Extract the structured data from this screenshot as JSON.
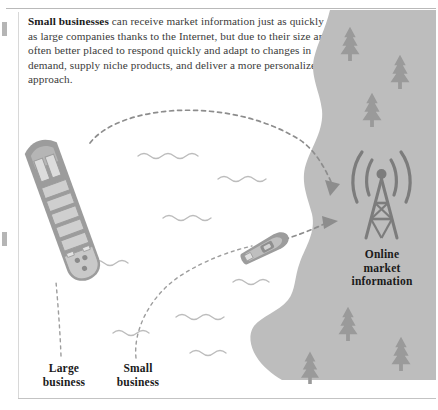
{
  "figure": {
    "paragraph": {
      "lead": "Small businesses",
      "rest": " can receive market information just as quickly as large companies thanks to the Internet, but due to their size are often better placed to respond quickly and adapt to changes in demand, supply niche products, and deliver a more personalized approach."
    },
    "labels": {
      "large_business": "Large\nbusiness",
      "large_business_line1": "Large",
      "large_business_line2": "business",
      "small_business_line1": "Small",
      "small_business_line2": "business",
      "online_line1": "Online",
      "online_line2": "market",
      "online_line3": "information"
    },
    "icons": {
      "large_ship": "cargo-ship-icon",
      "small_boat": "speedboat-icon",
      "tower": "radio-tower-icon",
      "trees": "pine-tree-icon",
      "waves": "water-wave-icon",
      "arrow_top": "dashed-arrow-icon",
      "arrow_bottom": "dashed-arrow-icon"
    },
    "colors": {
      "land": "#bdbdbd",
      "tree": "#9a9a9a",
      "tower": "#7c7c7c",
      "ship_body": "#9c9c9c",
      "ship_deck": "#c4c4c4",
      "wave": "#b9b9b9",
      "arrow": "#8d8d8d",
      "text": "#3a3a3a",
      "heading": "#1a1a1a",
      "rule": "#b9b9b9"
    },
    "counts": {
      "trees": 6,
      "waves": 8,
      "arrows": 2
    }
  }
}
